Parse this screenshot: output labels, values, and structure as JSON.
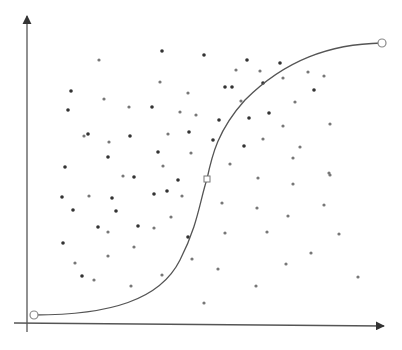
{
  "chart_data": {
    "type": "scatter",
    "title": "",
    "xlabel": "",
    "ylabel": "",
    "grid": false,
    "legend": null,
    "axes": {
      "origin": [
        30,
        323
      ],
      "x_end": [
        384,
        326
      ],
      "y_end": [
        27,
        16
      ],
      "color": "#555555"
    },
    "curve": {
      "type": "sigmoid",
      "color": "#555555",
      "start_point": [
        34,
        315
      ],
      "mid_point": [
        207,
        179
      ],
      "end_point": [
        382,
        43
      ],
      "path": "M34,315 C110,315 160,300 180,260 C198,225 200,200 207,179 C212,155 218,130 245,100 C285,60 330,44 382,43"
    },
    "points_color_dark": "#333333",
    "points_color_light": "#777777",
    "points": [
      [
        162,
        51,
        "d"
      ],
      [
        99,
        60,
        "l"
      ],
      [
        160,
        82,
        "l"
      ],
      [
        71,
        91,
        "d"
      ],
      [
        188,
        93,
        "l"
      ],
      [
        104,
        99,
        "l"
      ],
      [
        68,
        110,
        "d"
      ],
      [
        129,
        107,
        "l"
      ],
      [
        152,
        107,
        "d"
      ],
      [
        180,
        112,
        "l"
      ],
      [
        196,
        115,
        "l"
      ],
      [
        84,
        136,
        "l"
      ],
      [
        88,
        134,
        "d"
      ],
      [
        130,
        136,
        "d"
      ],
      [
        168,
        134,
        "l"
      ],
      [
        189,
        132,
        "d"
      ],
      [
        109,
        142,
        "l"
      ],
      [
        158,
        152,
        "d"
      ],
      [
        191,
        153,
        "l"
      ],
      [
        108,
        157,
        "d"
      ],
      [
        163,
        166,
        "l"
      ],
      [
        65,
        167,
        "d"
      ],
      [
        204,
        55,
        "d"
      ],
      [
        247,
        60,
        "d"
      ],
      [
        280,
        63,
        "d"
      ],
      [
        236,
        70,
        "l"
      ],
      [
        260,
        71,
        "l"
      ],
      [
        308,
        72,
        "l"
      ],
      [
        324,
        76,
        "l"
      ],
      [
        283,
        78,
        "l"
      ],
      [
        225,
        87,
        "d"
      ],
      [
        232,
        87,
        "d"
      ],
      [
        263,
        83,
        "d"
      ],
      [
        314,
        90,
        "d"
      ],
      [
        241,
        101,
        "l"
      ],
      [
        295,
        102,
        "l"
      ],
      [
        269,
        113,
        "d"
      ],
      [
        249,
        118,
        "d"
      ],
      [
        219,
        120,
        "d"
      ],
      [
        283,
        126,
        "l"
      ],
      [
        330,
        124,
        "l"
      ],
      [
        263,
        139,
        "l"
      ],
      [
        213,
        140,
        "d"
      ],
      [
        244,
        146,
        "d"
      ],
      [
        300,
        147,
        "l"
      ],
      [
        293,
        158,
        "l"
      ],
      [
        230,
        164,
        "l"
      ],
      [
        329,
        173,
        "l"
      ],
      [
        62,
        197,
        "d"
      ],
      [
        89,
        196,
        "l"
      ],
      [
        112,
        198,
        "d"
      ],
      [
        154,
        194,
        "d"
      ],
      [
        167,
        191,
        "d"
      ],
      [
        178,
        180,
        "d"
      ],
      [
        182,
        196,
        "l"
      ],
      [
        73,
        210,
        "d"
      ],
      [
        116,
        211,
        "d"
      ],
      [
        171,
        217,
        "l"
      ],
      [
        98,
        227,
        "d"
      ],
      [
        138,
        226,
        "d"
      ],
      [
        154,
        228,
        "l"
      ],
      [
        108,
        232,
        "l"
      ],
      [
        63,
        243,
        "d"
      ],
      [
        134,
        247,
        "l"
      ],
      [
        108,
        256,
        "l"
      ],
      [
        75,
        263,
        "l"
      ],
      [
        188,
        237,
        "d"
      ],
      [
        192,
        259,
        "l"
      ],
      [
        82,
        276,
        "d"
      ],
      [
        94,
        280,
        "l"
      ],
      [
        162,
        275,
        "l"
      ],
      [
        131,
        286,
        "l"
      ],
      [
        123,
        176,
        "l"
      ],
      [
        134,
        177,
        "d"
      ],
      [
        258,
        178,
        "l"
      ],
      [
        293,
        184,
        "l"
      ],
      [
        222,
        203,
        "l"
      ],
      [
        257,
        208,
        "l"
      ],
      [
        324,
        205,
        "l"
      ],
      [
        288,
        216,
        "l"
      ],
      [
        225,
        233,
        "l"
      ],
      [
        267,
        232,
        "l"
      ],
      [
        339,
        234,
        "l"
      ],
      [
        311,
        253,
        "l"
      ],
      [
        286,
        264,
        "l"
      ],
      [
        218,
        269,
        "l"
      ],
      [
        358,
        277,
        "l"
      ],
      [
        256,
        286,
        "l"
      ],
      [
        204,
        303,
        "l"
      ],
      [
        330,
        175,
        "l"
      ]
    ]
  }
}
